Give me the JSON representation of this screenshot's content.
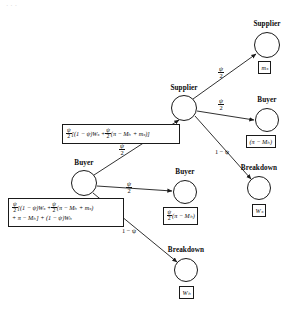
{
  "figure": {
    "type": "game-tree-diagram",
    "background": "#ffffff",
    "stroke": "#1a1a1a",
    "corner_marks": "···"
  },
  "nodes": [
    {
      "id": "supplier-top",
      "label": "Supplier",
      "cx": 267,
      "cy": 45,
      "r": 13
    },
    {
      "id": "supplier-mid",
      "label": "Supplier",
      "cx": 184,
      "cy": 108,
      "r": 13
    },
    {
      "id": "buyer-top",
      "label": "Buyer",
      "cx": 267,
      "cy": 120,
      "r": 12
    },
    {
      "id": "breakdown-upper",
      "label": "Breakdown",
      "cx": 259,
      "cy": 188,
      "r": 12
    },
    {
      "id": "buyer-mid",
      "label": "Buyer",
      "cx": 84,
      "cy": 183,
      "r": 13
    },
    {
      "id": "buyer-right",
      "label": "Buyer",
      "cx": 185,
      "cy": 192,
      "r": 12
    },
    {
      "id": "breakdown-lower",
      "label": "Breakdown",
      "cx": 186,
      "cy": 270,
      "r": 12
    }
  ],
  "edges": [
    {
      "id": "mid-to-supplier-top",
      "label_num": "ψ",
      "label_den": "2"
    },
    {
      "id": "mid-to-buyer-top",
      "label_num": "ψ",
      "label_den": "2"
    },
    {
      "id": "mid-to-breakdown",
      "label": "1 − ψ"
    },
    {
      "id": "buyer-to-supplier-mid",
      "label_num": "ψ",
      "label_den": "2"
    },
    {
      "id": "buyer-to-buyer-right",
      "label_num": "ψ",
      "label_den": "2"
    },
    {
      "id": "buyer-to-breakdown",
      "label": "1 − ψ"
    }
  ],
  "payoffs": {
    "supplier_top": {
      "text": "mₛ"
    },
    "buyer_top": {
      "text": "(π − Mₕ)"
    },
    "breakdown_upper": {
      "text": "Wₛ"
    },
    "buyer_right": {
      "frac_num": "ψ",
      "frac_den": "2",
      "rest": "(π − Mₕ)"
    },
    "breakdown_lower": {
      "text": "Wₕ"
    },
    "supplier_mid_box": {
      "line1_frac_num": "ψ",
      "line1_frac_den": "2",
      "line1_a": "[(1 − ψ)Wₛ +",
      "line1_frac2_num": "ψ",
      "line1_frac2_den": "2",
      "line1_b": "(π − Mₕ + mₛ)]"
    },
    "buyer_mid_box": {
      "line1_frac_num": "ψ",
      "line1_frac_den": "2",
      "line1_a": "[(1 − ψ)Wₛ +",
      "line1_frac2_num": "ψ",
      "line1_frac2_den": "2",
      "line1_b": "(π − Mₕ + mₛ)",
      "line2": "+ π − Mₕ] + (1 − ψ)Wₕ"
    }
  }
}
